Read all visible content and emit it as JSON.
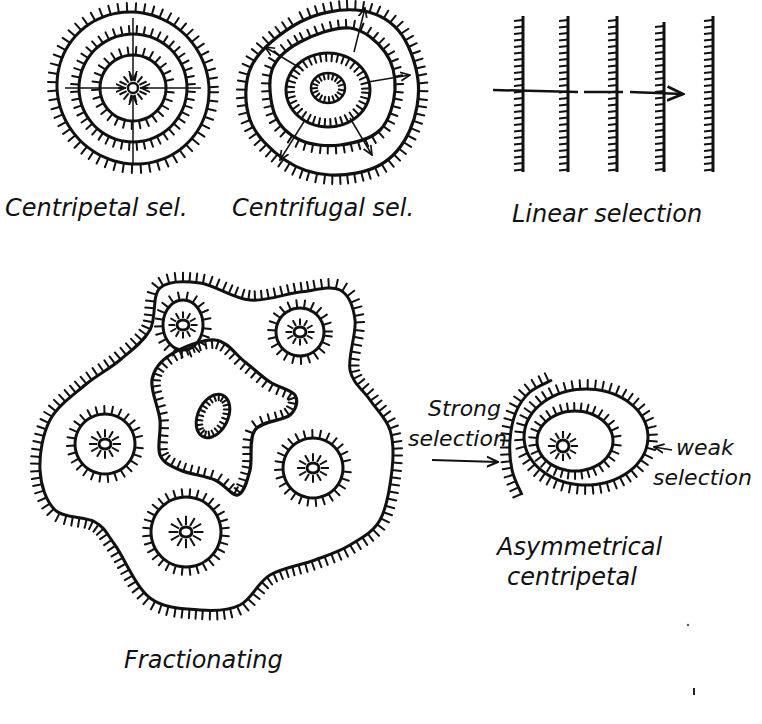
{
  "figure": {
    "ink_color": "#111111",
    "background": "#ffffff",
    "panels": [
      {
        "id": "centripetal",
        "label": "Centripetal sel.",
        "rings": 4,
        "tick_direction": "inward",
        "arrows": "converging"
      },
      {
        "id": "centrifugal",
        "label": "Centrifugal sel.",
        "rings": 4,
        "tick_direction": "inward",
        "arrows": "diverging"
      },
      {
        "id": "linear",
        "label": "Linear selection",
        "lines": 5,
        "tick_direction": "left",
        "arrows": "horizontal-right"
      },
      {
        "id": "fractionating",
        "label": "Fractionating",
        "sub_centers": 6
      },
      {
        "id": "asymmetrical",
        "label_line1": "Asymmetrical",
        "label_line2": "centripetal",
        "strong_label_line1": "Strong",
        "strong_label_line2": "selection",
        "weak_label_line1": "weak",
        "weak_label_line2": "selection"
      }
    ]
  }
}
